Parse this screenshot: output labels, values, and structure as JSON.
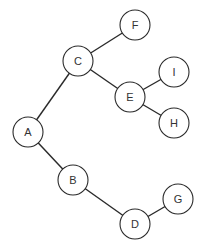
{
  "diagram": {
    "type": "tree",
    "radius": 15,
    "nodes": [
      {
        "id": "A",
        "label": "A",
        "x": 28,
        "y": 132
      },
      {
        "id": "B",
        "label": "B",
        "x": 73,
        "y": 180
      },
      {
        "id": "C",
        "label": "C",
        "x": 78,
        "y": 61
      },
      {
        "id": "D",
        "label": "D",
        "x": 135,
        "y": 224
      },
      {
        "id": "E",
        "label": "E",
        "x": 130,
        "y": 97
      },
      {
        "id": "F",
        "label": "F",
        "x": 135,
        "y": 25
      },
      {
        "id": "G",
        "label": "G",
        "x": 178,
        "y": 199
      },
      {
        "id": "H",
        "label": "H",
        "x": 174,
        "y": 123
      },
      {
        "id": "I",
        "label": "I",
        "x": 174,
        "y": 72
      }
    ],
    "edges": [
      {
        "from": "A",
        "to": "C"
      },
      {
        "from": "A",
        "to": "B"
      },
      {
        "from": "C",
        "to": "F"
      },
      {
        "from": "C",
        "to": "E"
      },
      {
        "from": "E",
        "to": "I"
      },
      {
        "from": "E",
        "to": "H"
      },
      {
        "from": "B",
        "to": "D"
      },
      {
        "from": "D",
        "to": "G"
      }
    ]
  }
}
